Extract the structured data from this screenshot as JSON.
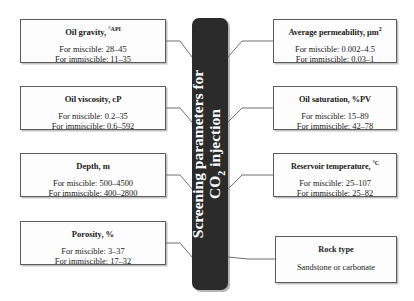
{
  "diagram": {
    "title": "Screening parameters for CO2 injection",
    "banner": {
      "line1": "Screening parameters for",
      "line2_prefix": "CO",
      "line2_sub": "2",
      "line2_suffix": " injection"
    },
    "label_prefix_miscible": "For miscible: ",
    "label_prefix_immiscible": "For immiscible: ",
    "colors": {
      "banner_background": "#2b2b2b",
      "banner_text": "#ffffff",
      "box_background": "#fdfdfd",
      "box_border": "#5c5c5c",
      "connector": "#6e6e6e",
      "page_background": "#ffffff"
    }
  },
  "left_boxes": [
    {
      "title": "Oil gravity, ",
      "title_sup": "°API",
      "miscible": "For miscible: 28–45",
      "immiscible": "For immiscible: 11–35"
    },
    {
      "title": "Oil viscosity, cP",
      "title_sup": "",
      "miscible": "For miscible: 0.2–35",
      "immiscible": "For immiscible: 0.6–592"
    },
    {
      "title": "Depth, m",
      "title_sup": "",
      "miscible": "For miscible: 500–4500",
      "immiscible": "For immiscible: 400–2800"
    },
    {
      "title": "Porosity, %",
      "title_sup": "",
      "miscible": "For miscible: 3–37",
      "immiscible": "For immiscible: 17–32"
    }
  ],
  "right_boxes": [
    {
      "title": "Average permeability, µm",
      "title_sup": "2",
      "miscible": "For miscible: 0.002–4.5",
      "immiscible": "For immiscible: 0.03–1"
    },
    {
      "title": "Oil saturation, %PV",
      "title_sup": "",
      "miscible": "For miscible: 15–89",
      "immiscible": "For immiscible: 42–78"
    },
    {
      "title": "Reservoir temperature, ",
      "title_sup": "°C",
      "miscible": "For miscible: 25–107",
      "immiscible": "For immiscible: 25–82"
    },
    {
      "title": "Rock type",
      "title_sup": "",
      "miscible": "Sandstone or carbonate",
      "immiscible": ""
    }
  ]
}
